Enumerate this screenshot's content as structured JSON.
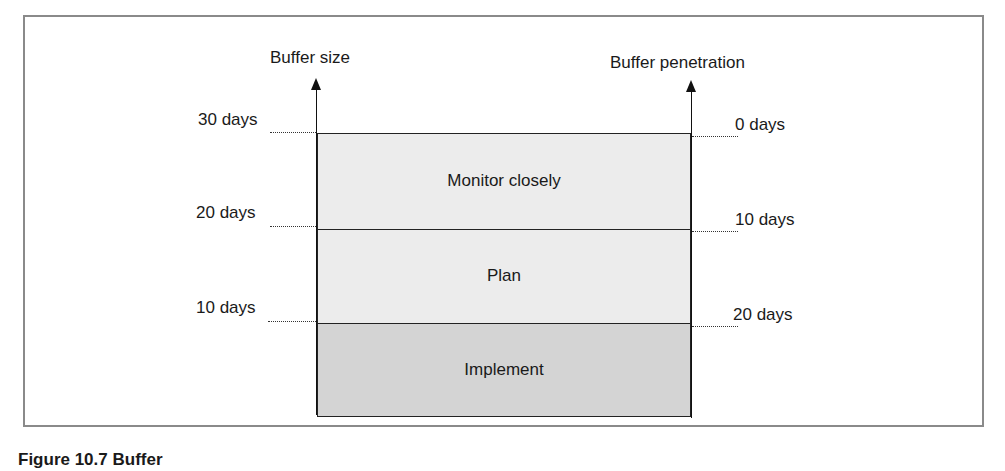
{
  "diagram": {
    "left_axis": {
      "title": "Buffer size",
      "ticks": [
        "30 days",
        "20 days",
        "10 days"
      ]
    },
    "right_axis": {
      "title": "Buffer penetration",
      "ticks": [
        "0 days",
        "10 days",
        "20 days"
      ]
    },
    "zones": [
      {
        "label": "Monitor closely",
        "color": "#ececec"
      },
      {
        "label": "Plan",
        "color": "#ececec"
      },
      {
        "label": "Implement",
        "color": "#d4d4d4"
      }
    ]
  },
  "caption": "Figure 10.7 Buffer"
}
